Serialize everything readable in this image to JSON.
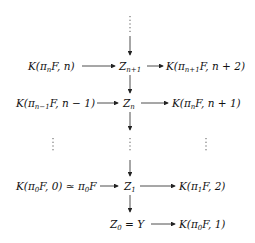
{
  "diagram": {
    "type": "postnikov-tower",
    "nodes": {
      "top_dots": "⋮",
      "k_pin_n": "K(π<sub>n</sub>F, n)",
      "z_n1": "Z<sub>n+1</sub>",
      "k_pin1_n2": "K(π<sub>n+1</sub>F, n + 2)",
      "k_pin_1_n_1": "K(π<sub>n−1</sub>F, n − 1)",
      "z_n": "Z<sub>n</sub>",
      "k_pin_n1": "K(π<sub>n</sub>F, n + 1)",
      "dots_left": "⋮",
      "dots_mid": "⋮",
      "dots_right": "⋮",
      "k_pi0_0": "K(π<sub>0</sub>F, 0) ≃ π<sub>0</sub>F",
      "z_1": "Z<sub>1</sub>",
      "k_pi1_2": "K(π<sub>1</sub>F, 2)",
      "z_0": "Z<sub>0</sub> = Y",
      "k_pi0_1": "K(π<sub>0</sub>F, 1)"
    },
    "arrows": [
      {
        "from": "top_dots",
        "to": "z_n1"
      },
      {
        "from": "k_pin_n",
        "to": "z_n1"
      },
      {
        "from": "z_n1",
        "to": "k_pin1_n2"
      },
      {
        "from": "z_n1",
        "to": "z_n"
      },
      {
        "from": "k_pin_1_n_1",
        "to": "z_n"
      },
      {
        "from": "z_n",
        "to": "k_pin_n1"
      },
      {
        "from": "z_n",
        "to": "dots_mid"
      },
      {
        "from": "dots_mid",
        "to": "z_1"
      },
      {
        "from": "k_pi0_0",
        "to": "z_1"
      },
      {
        "from": "z_1",
        "to": "k_pi1_2"
      },
      {
        "from": "z_1",
        "to": "z_0"
      },
      {
        "from": "z_0",
        "to": "k_pi0_1"
      }
    ]
  }
}
